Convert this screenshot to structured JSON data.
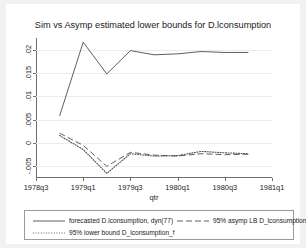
{
  "chart_data": {
    "type": "line",
    "title": "Sim vs Asymp estimated lower bounds for D.lconsumption",
    "xlabel": "qtr",
    "ylabel": "",
    "grid": true,
    "legend_position": "bottom",
    "xlim": [
      1978.5,
      1981.0
    ],
    "ylim": [
      -0.0075,
      0.0225
    ],
    "xticks": [
      "1978q3",
      "1979q1",
      "1979q3",
      "1980q1",
      "1980q3",
      "1981q1"
    ],
    "xtick_values": [
      1978.5,
      1979.0,
      1979.5,
      1980.0,
      1980.5,
      1981.0
    ],
    "yticks": [
      "-.005",
      "0",
      ".005",
      ".01",
      ".015",
      ".02"
    ],
    "ytick_values": [
      -0.005,
      0,
      0.005,
      0.01,
      0.015,
      0.02
    ],
    "x": [
      1978.75,
      1979.0,
      1979.25,
      1979.5,
      1979.75,
      1980.0,
      1980.25,
      1980.5,
      1980.75
    ],
    "series": [
      {
        "name": "forecasted D.lconsumption, dyn(77)",
        "style": "solid",
        "color": "#4d4d4d",
        "values": [
          0.0058,
          0.0216,
          0.0148,
          0.0198,
          0.0189,
          0.0191,
          0.0196,
          0.0194,
          0.0194
        ]
      },
      {
        "name": "95% asymp LB D_lconsumption",
        "style": "dashed",
        "color": "#4d4d4d",
        "values": [
          0.0021,
          -0.0005,
          -0.005,
          -0.002,
          -0.0026,
          -0.0028,
          -0.0023,
          -0.0025,
          -0.0024
        ]
      },
      {
        "name": "95% lower bound D_lconsumption_f",
        "style": "dotted",
        "color": "#4d4d4d",
        "values": [
          0.0016,
          -0.0014,
          -0.0065,
          -0.0023,
          -0.0028,
          -0.0027,
          -0.0018,
          -0.0021,
          -0.0023
        ]
      }
    ]
  },
  "legend": {
    "entries": [
      {
        "label": "forecasted D.lconsumption, dyn(77)",
        "style": "solid"
      },
      {
        "label": "95% asymp LB D_lconsumption",
        "style": "dashed"
      },
      {
        "label": "95% lower bound D_lconsumption_f",
        "style": "dotted"
      }
    ]
  },
  "colors": {
    "background": "#f2f2f0",
    "canvas": "#ffffff",
    "axis": "#6f6f6f",
    "grid": "#ececec",
    "line": "#4d4d4d",
    "text": "#1a1a1a"
  }
}
